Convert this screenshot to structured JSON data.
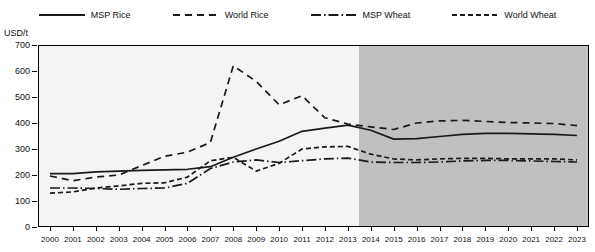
{
  "chart_data": {
    "type": "line",
    "title": "",
    "xlabel": "",
    "ylabel": "USD/t",
    "ylim": [
      0,
      700
    ],
    "yticks": [
      0,
      100,
      200,
      300,
      400,
      500,
      600,
      700
    ],
    "xlim": [
      2000,
      2023
    ],
    "grid": false,
    "legend_position": "top",
    "x": [
      2000,
      2001,
      2002,
      2003,
      2004,
      2005,
      2006,
      2007,
      2008,
      2009,
      2010,
      2011,
      2012,
      2013,
      2014,
      2015,
      2016,
      2017,
      2018,
      2019,
      2020,
      2021,
      2022,
      2023
    ],
    "categories": [
      "2000",
      "2001",
      "2002",
      "2003",
      "2004",
      "2005",
      "2006",
      "2007",
      "2008",
      "2009",
      "2010",
      "2011",
      "2012",
      "2013",
      "2014",
      "2015",
      "2016",
      "2017",
      "2018",
      "2019",
      "2020",
      "2021",
      "2022",
      "2023"
    ],
    "projection_start": 2013.5,
    "series": [
      {
        "name": "MSP Rice",
        "style": "solid",
        "color": "#1a1a1a",
        "values": [
          205,
          205,
          212,
          215,
          218,
          220,
          222,
          232,
          268,
          300,
          330,
          368,
          380,
          392,
          372,
          338,
          340,
          348,
          356,
          360,
          360,
          358,
          356,
          352
        ]
      },
      {
        "name": "World Rice",
        "style": "dashed",
        "color": "#1a1a1a",
        "values": [
          196,
          178,
          192,
          200,
          236,
          272,
          288,
          325,
          620,
          560,
          470,
          505,
          420,
          396,
          385,
          375,
          400,
          408,
          410,
          406,
          402,
          400,
          398,
          390
        ]
      },
      {
        "name": "MSP Wheat",
        "style": "dashdot",
        "color": "#1a1a1a",
        "values": [
          150,
          150,
          148,
          145,
          148,
          150,
          168,
          225,
          250,
          258,
          248,
          255,
          262,
          265,
          250,
          248,
          248,
          250,
          254,
          256,
          256,
          254,
          252,
          250
        ]
      },
      {
        "name": "World Wheat",
        "style": "dotted-dash",
        "color": "#1a1a1a",
        "values": [
          130,
          135,
          150,
          158,
          168,
          170,
          192,
          255,
          268,
          215,
          245,
          300,
          308,
          310,
          280,
          262,
          258,
          262,
          264,
          264,
          262,
          262,
          262,
          258
        ]
      }
    ]
  },
  "legend": {
    "items": [
      {
        "label": "MSP Rice",
        "style": "solid"
      },
      {
        "label": "World Rice",
        "style": "dashed"
      },
      {
        "label": "MSP Wheat",
        "style": "dashdot"
      },
      {
        "label": "World Wheat",
        "style": "dotted-dash"
      }
    ]
  },
  "axis": {
    "y_title": "USD/t"
  },
  "colors": {
    "plot_background": "#f4f4f4",
    "projection_background": "#c0c0c0",
    "line": "#1a1a1a",
    "frame": "#000000"
  }
}
